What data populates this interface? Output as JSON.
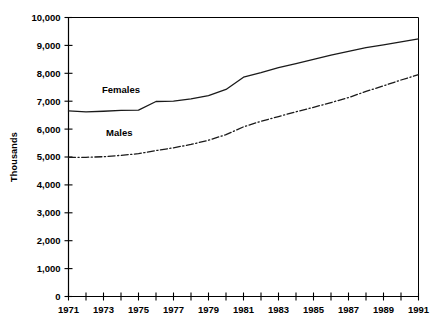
{
  "chart_data": {
    "type": "line",
    "title": "",
    "xlabel": "",
    "ylabel": "Thousands",
    "xlim": [
      1971,
      1991
    ],
    "ylim": [
      0,
      10000
    ],
    "ytick_step": 1000,
    "xtick_step": 1,
    "xlabel_step": 2,
    "grid": false,
    "legend_position": "inline-annotations",
    "axis_color": "#000000",
    "x": [
      1971,
      1972,
      1973,
      1974,
      1975,
      1976,
      1977,
      1978,
      1979,
      1980,
      1981,
      1982,
      1983,
      1984,
      1985,
      1986,
      1987,
      1988,
      1989,
      1990,
      1991
    ],
    "xtick_labels": [
      "1971",
      "",
      "1973",
      "",
      "1975",
      "",
      "1977",
      "",
      "1979",
      "",
      "1981",
      "",
      "1983",
      "",
      "1985",
      "",
      "1987",
      "",
      "1989",
      "",
      "1991"
    ],
    "ytick_labels": [
      "0",
      "1,000",
      "2,000",
      "3,000",
      "4,000",
      "5,000",
      "6,000",
      "7,000",
      "8,000",
      "9,000",
      "10,000"
    ],
    "ytick_values": [
      0,
      1000,
      2000,
      3000,
      4000,
      5000,
      6000,
      7000,
      8000,
      9000,
      10000
    ],
    "series": [
      {
        "name": "Females",
        "style": "solid",
        "color": "#1a1a1a",
        "label_x": 1974.0,
        "label_y": 7300,
        "values": [
          6650,
          6620,
          6640,
          6670,
          6680,
          6990,
          7000,
          7080,
          7200,
          7420,
          7860,
          8020,
          8200,
          8350,
          8500,
          8650,
          8790,
          8920,
          9020,
          9130,
          9230
        ]
      },
      {
        "name": "Males",
        "style": "dashdot",
        "color": "#1a1a1a",
        "label_x": 1973.9,
        "label_y": 5740,
        "values": [
          4990,
          4990,
          5010,
          5060,
          5120,
          5230,
          5330,
          5450,
          5600,
          5800,
          6080,
          6280,
          6450,
          6620,
          6780,
          6950,
          7130,
          7350,
          7550,
          7760,
          7950
        ]
      }
    ]
  }
}
